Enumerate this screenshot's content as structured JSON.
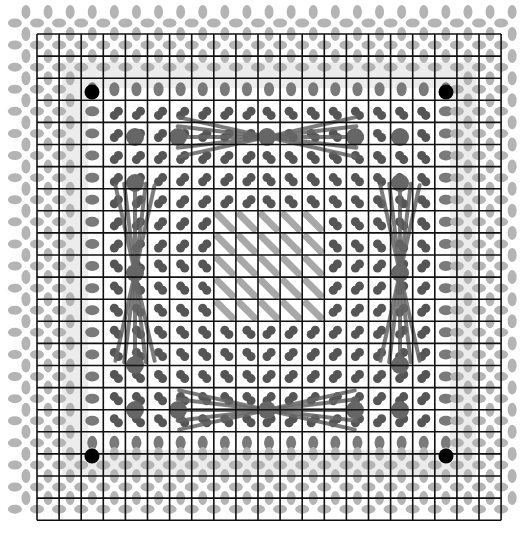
{
  "figure": {
    "width": 529,
    "height": 548
  },
  "grid": {
    "origin_x": 37,
    "origin_y": 34,
    "cell": 22.1,
    "cols": 21,
    "rows": 22,
    "line_color": "#111111",
    "line_width": 1.6
  },
  "colors": {
    "outer_glyph": "#b4b4b4",
    "ring_glyph": "#7a7a7a",
    "inner_glyph": "#555555",
    "ring_band": "#ececec",
    "diagonal_fill": "#a8a8a8",
    "big_dot": "#666666",
    "fan_line": "#666666",
    "anchor": "#000000"
  },
  "regions": {
    "ring_index": 2,
    "inner_start": 3,
    "inner_end": 18,
    "diagonal_block": {
      "col_start": 8,
      "col_end": 12,
      "row_start": 8,
      "row_end": 12
    }
  },
  "anchors": [
    {
      "x": 92,
      "y": 92
    },
    {
      "x": 446,
      "y": 92
    },
    {
      "x": 92,
      "y": 456
    },
    {
      "x": 446,
      "y": 456
    }
  ],
  "big_dots": [
    {
      "x": 135,
      "y": 137
    },
    {
      "x": 178,
      "y": 137
    },
    {
      "x": 267,
      "y": 137
    },
    {
      "x": 355,
      "y": 137
    },
    {
      "x": 400,
      "y": 137
    },
    {
      "x": 135,
      "y": 183
    },
    {
      "x": 400,
      "y": 183
    },
    {
      "x": 135,
      "y": 273
    },
    {
      "x": 400,
      "y": 273
    },
    {
      "x": 135,
      "y": 365
    },
    {
      "x": 400,
      "y": 365
    },
    {
      "x": 135,
      "y": 410
    },
    {
      "x": 178,
      "y": 410
    },
    {
      "x": 267,
      "y": 410
    },
    {
      "x": 355,
      "y": 410
    },
    {
      "x": 400,
      "y": 410
    }
  ],
  "fans": [
    {
      "name": "top",
      "cx": 267,
      "cy": 137,
      "orient": "h",
      "length": 90
    },
    {
      "name": "bottom",
      "cx": 267,
      "cy": 410,
      "orient": "h",
      "length": 90
    },
    {
      "name": "left",
      "cx": 135,
      "cy": 273,
      "orient": "v",
      "length": 90
    },
    {
      "name": "right",
      "cx": 400,
      "cy": 273,
      "orient": "v",
      "length": 90
    }
  ]
}
